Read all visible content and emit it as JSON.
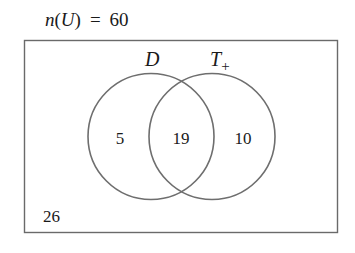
{
  "title": {
    "func": "n",
    "arg": "U",
    "equals": "=",
    "value": "60"
  },
  "universe": {
    "label": "U",
    "total": 60,
    "outside_value": "26"
  },
  "sets": [
    {
      "name": "D",
      "subscript": "",
      "only_value": "5"
    },
    {
      "name": "T",
      "subscript": "+",
      "only_value": "10"
    }
  ],
  "intersection_value": "19",
  "colors": {
    "stroke": "#6e6e6e",
    "text": "#1a1a1a",
    "background": "#ffffff"
  }
}
